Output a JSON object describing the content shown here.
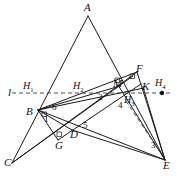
{
  "figure": {
    "type": "geometry-diagram",
    "width": 177,
    "height": 176,
    "background": "#ffffff",
    "stroke_color": "#1a1a1a",
    "dash_color": "#3a3a3a"
  },
  "vertices": [
    {
      "id": "A",
      "label": "A",
      "x": 88,
      "y": 12,
      "lx": 84,
      "ly": 2
    },
    {
      "id": "B",
      "label": "B",
      "x": 38,
      "y": 110,
      "lx": 26,
      "ly": 106
    },
    {
      "id": "C",
      "label": "C",
      "x": 12,
      "y": 163,
      "lx": 4,
      "ly": 157
    },
    {
      "id": "D",
      "label": "D",
      "x": 72,
      "y": 130,
      "lx": 70,
      "ly": 129
    },
    {
      "id": "E",
      "label": "E",
      "x": 165,
      "y": 160,
      "lx": 163,
      "ly": 160
    },
    {
      "id": "F",
      "label": "F",
      "x": 137,
      "y": 72,
      "lx": 136,
      "ly": 63
    },
    {
      "id": "G",
      "label": "G",
      "x": 58,
      "y": 140,
      "lx": 55,
      "ly": 140
    },
    {
      "id": "K",
      "label": "K",
      "x": 143,
      "y": 87,
      "lx": 142,
      "ly": 81
    },
    {
      "id": "M",
      "label": "M",
      "x": 118,
      "y": 85,
      "lx": 113,
      "ly": 78
    }
  ],
  "marked_points": [
    {
      "id": "H1",
      "label": "H",
      "subscript": "1",
      "lx": 23,
      "ly": 81
    },
    {
      "id": "H2",
      "label": "H",
      "subscript": "2",
      "lx": 73,
      "ly": 81
    },
    {
      "id": "H3",
      "label": "H",
      "subscript": "3",
      "lx": 124,
      "ly": 95
    },
    {
      "id": "H4",
      "label": "H",
      "subscript": "4",
      "lx": 155,
      "ly": 78,
      "dot_x": 162,
      "dot_y": 93
    }
  ],
  "line_labels": [
    {
      "id": "l",
      "label": "l",
      "lx": 8,
      "ly": 87
    }
  ],
  "angle_numbers": [
    {
      "id": "n1",
      "label": "1",
      "lx": 44,
      "ly": 115
    },
    {
      "id": "n2",
      "label": "2",
      "lx": 98,
      "ly": 93
    },
    {
      "id": "n3",
      "label": "3",
      "lx": 151,
      "ly": 141
    },
    {
      "id": "n4",
      "label": "4",
      "lx": 118,
      "ly": 101
    },
    {
      "id": "n5",
      "label": "5",
      "lx": 83,
      "ly": 121
    },
    {
      "id": "n6",
      "label": "6",
      "lx": 52,
      "ly": 103
    }
  ],
  "segments": [
    {
      "name": "A-C",
      "from": "A",
      "to": "C",
      "x1": 88,
      "y1": 16,
      "x2": 12,
      "y2": 163
    },
    {
      "name": "A-E",
      "from": "A",
      "to": "E",
      "x1": 88,
      "y1": 16,
      "x2": 165,
      "y2": 160
    },
    {
      "name": "B-E",
      "from": "B",
      "to": "E",
      "x1": 38,
      "y1": 110,
      "x2": 165,
      "y2": 160
    },
    {
      "name": "B-F",
      "from": "B",
      "to": "F",
      "x1": 38,
      "y1": 110,
      "x2": 137,
      "y2": 72
    },
    {
      "name": "B-K",
      "from": "B",
      "to": "K",
      "x1": 38,
      "y1": 110,
      "x2": 144,
      "y2": 88
    },
    {
      "name": "B-M",
      "from": "B",
      "to": "M",
      "x1": 38,
      "y1": 110,
      "x2": 120,
      "y2": 86
    },
    {
      "name": "C-F",
      "from": "C",
      "to": "F",
      "x1": 12,
      "y1": 163,
      "x2": 137,
      "y2": 72
    },
    {
      "name": "C-D-M",
      "from": "C",
      "to": "M",
      "x1": 12,
      "y1": 163,
      "x2": 133,
      "y2": 76
    },
    {
      "name": "B-G-E-side",
      "from": "B",
      "to": "D",
      "x1": 38,
      "y1": 110,
      "x2": 72,
      "y2": 130
    },
    {
      "name": "F-E",
      "from": "F",
      "to": "E",
      "x1": 137,
      "y1": 72,
      "x2": 165,
      "y2": 160
    },
    {
      "name": "K-E",
      "from": "K",
      "to": "E",
      "x1": 143,
      "y1": 87,
      "x2": 165,
      "y2": 160
    },
    {
      "name": "M-E",
      "from": "M",
      "to": "E",
      "x1": 118,
      "y1": 85,
      "x2": 165,
      "y2": 160
    },
    {
      "name": "D-E",
      "from": "D",
      "to": "E",
      "x1": 72,
      "y1": 130,
      "x2": 165,
      "y2": 160
    },
    {
      "name": "G-K-upper",
      "from": "G",
      "to": "K",
      "x1": 58,
      "y1": 140,
      "x2": 141,
      "y2": 84
    },
    {
      "name": "B-G",
      "from": "B",
      "to": "G",
      "x1": 38,
      "y1": 110,
      "x2": 58,
      "y2": 140
    }
  ],
  "dashed_segments": [
    {
      "name": "line-l-horizontal",
      "x1": 12,
      "y1": 93,
      "x2": 172,
      "y2": 93
    },
    {
      "name": "H3-to-E-dashed",
      "x1": 126,
      "y1": 101,
      "x2": 160,
      "y2": 152
    }
  ],
  "right_angle_marks": [
    {
      "name": "right-angle-at-M",
      "x": 115,
      "y": 78
    },
    {
      "name": "right-angle-at-F",
      "x": 130,
      "y": 74
    },
    {
      "name": "right-angle-at-G",
      "x": 57,
      "y": 132
    },
    {
      "name": "right-angle-at-B",
      "x": 42,
      "y": 112
    }
  ]
}
